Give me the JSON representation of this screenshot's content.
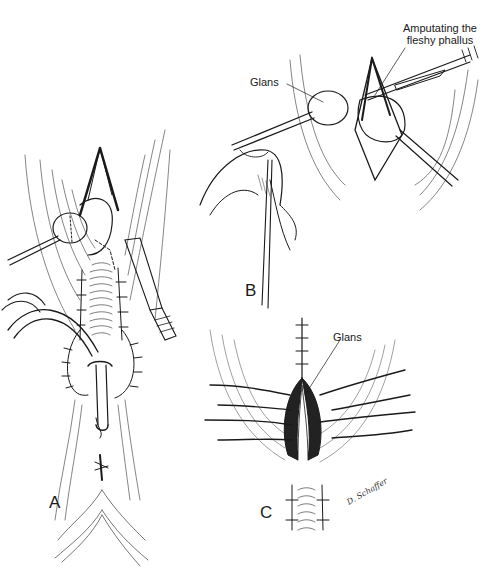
{
  "figure": {
    "panels": [
      {
        "id": "A",
        "label": "A"
      },
      {
        "id": "B",
        "label": "B"
      },
      {
        "id": "C",
        "label": "C"
      }
    ],
    "annotations": {
      "amputating_line1": "Amputating the",
      "amputating_line2": "fleshy phallus",
      "glans_b": "Glans",
      "glans_c": "Glans"
    },
    "artist_signature": "D. Schaffer",
    "colors": {
      "ink": "#1a1a1a",
      "background": "#ffffff",
      "hatch": "#555555"
    }
  }
}
